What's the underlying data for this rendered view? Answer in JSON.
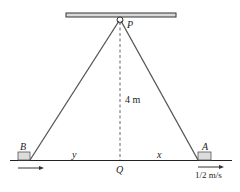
{
  "diagram": {
    "labels": {
      "pulley": "P",
      "height": "4 m",
      "block_left": "B",
      "block_right": "A",
      "ground_point": "Q",
      "left_distance": "y",
      "right_distance": "x",
      "speed": "1/2 m/s"
    },
    "colors": {
      "beam_fill": "#d9d9d9",
      "line": "#333333",
      "rope": "#555555",
      "block_fill": "#dcdcdc"
    }
  }
}
